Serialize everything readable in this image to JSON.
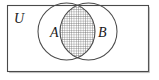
{
  "figure": {
    "name": "venn-diagram-two-sets-intersection-shaded",
    "type": "set-diagram",
    "background_color": "#ffffff",
    "stroke_color": "#4a4a4a",
    "label_color": "#1a1a1a",
    "hatch_color": "#555555"
  },
  "universe": {
    "label": "U",
    "shape": "rectangle",
    "description": "universal set border"
  },
  "sets": [
    {
      "id": "A",
      "label": "A",
      "shape": "circle",
      "position": "left"
    },
    {
      "id": "B",
      "label": "B",
      "shape": "circle",
      "position": "right"
    }
  ],
  "shaded_region": {
    "name": "A-intersect-B",
    "label": "",
    "fill_pattern": "cross-hatch-grid",
    "description": "lens shaped overlap of circle A and circle B is shaded"
  }
}
